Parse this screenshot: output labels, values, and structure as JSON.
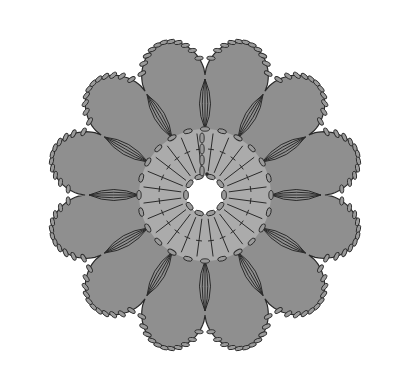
{
  "diagram": {
    "type": "crochet-chart",
    "title": "",
    "center": {
      "x": 205,
      "y": 195
    },
    "colors": {
      "background": "#ffffff",
      "inner_ring": "#ababab",
      "outer_petals": "#8f8f8f",
      "stroke": "#2a2a2a",
      "chain_fill": "#9a9a9a"
    },
    "rounds": [
      {
        "name": "center-ring",
        "description": "chain ring",
        "radius": 19,
        "chains": 10
      },
      {
        "name": "round-1",
        "description": "double crochet",
        "stitches": 24,
        "inner_radius": 20,
        "outer_radius": 64
      },
      {
        "name": "round-1-edge",
        "description": "chain loops",
        "radius": 66,
        "chains": 24
      },
      {
        "name": "round-2",
        "description": "petal clusters",
        "petals": 12,
        "petal_radius": 150,
        "petal_width": 38
      },
      {
        "name": "round-2-edge",
        "description": "chain scallops",
        "chains_per_petal": 8
      }
    ]
  }
}
